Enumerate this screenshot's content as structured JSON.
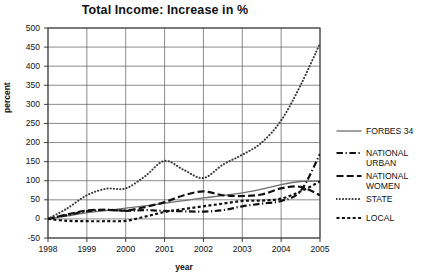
{
  "chart_data": {
    "type": "line",
    "title": "Total Income: Increase in %",
    "xlabel": "year",
    "ylabel": "percent",
    "grid": true,
    "legend_position": "right",
    "xlim": [
      1998,
      2005
    ],
    "ylim": [
      -50,
      500
    ],
    "ytick_labels": [
      "500",
      "450",
      "400",
      "350",
      "300",
      "250",
      "200",
      "150",
      "100",
      "50",
      "0",
      "-50"
    ],
    "yticks": [
      500,
      450,
      400,
      350,
      300,
      250,
      200,
      150,
      100,
      50,
      0,
      -50
    ],
    "xtick_labels": [
      "1998",
      "1999",
      "2000",
      "2001",
      "2002",
      "2003",
      "2004",
      "2005"
    ],
    "xticks": [
      1998,
      1999,
      2000,
      2001,
      2002,
      2003,
      2004,
      2005
    ],
    "x": [
      1998,
      1998.5,
      1999,
      1999.5,
      2000,
      2000.5,
      2001,
      2001.5,
      2002,
      2002.5,
      2003,
      2003.5,
      2004,
      2004.5,
      2005
    ],
    "series": [
      {
        "name": "FORBES 34",
        "style": "solid",
        "color": "#6e6e6e",
        "values": [
          0,
          8,
          16,
          22,
          28,
          34,
          41,
          48,
          55,
          61,
          68,
          78,
          90,
          98,
          99
        ]
      },
      {
        "name": "NATIONAL URBAN",
        "style": "dash-dot",
        "color": "#111111",
        "values": [
          0,
          10,
          20,
          24,
          21,
          23,
          21,
          20,
          19,
          23,
          33,
          40,
          47,
          73,
          170
        ]
      },
      {
        "name": "NATIONAL WOMEN",
        "style": "dashed",
        "color": "#111111",
        "values": [
          0,
          12,
          22,
          24,
          22,
          31,
          44,
          62,
          72,
          62,
          60,
          64,
          80,
          84,
          62
        ]
      },
      {
        "name": "STATE",
        "style": "dotted",
        "color": "#3a3a3a",
        "values": [
          0,
          28,
          62,
          79,
          80,
          112,
          152,
          128,
          107,
          142,
          168,
          200,
          258,
          350,
          460
        ]
      },
      {
        "name": "LOCAL",
        "style": "short-dash",
        "color": "#111111",
        "values": [
          0,
          -5,
          -6,
          -6,
          -5,
          6,
          18,
          26,
          33,
          40,
          47,
          48,
          53,
          72,
          98
        ]
      }
    ]
  },
  "legend": {
    "items": [
      {
        "label": "FORBES 34",
        "swatch": "solid-line-swatch"
      },
      {
        "label": "NATIONAL\nURBAN",
        "swatch": "dash-dot-line-swatch"
      },
      {
        "label": "NATIONAL\nWOMEN",
        "swatch": "dashed-line-swatch"
      },
      {
        "label": "STATE",
        "swatch": "dotted-line-swatch"
      },
      {
        "label": "LOCAL",
        "swatch": "short-dash-line-swatch"
      }
    ]
  }
}
